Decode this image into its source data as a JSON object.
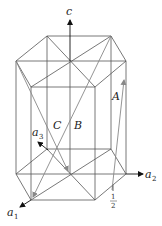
{
  "diagram": {
    "type": "hexagonal-prism-lattice",
    "labels": {
      "c": "c",
      "a1": "a",
      "a1_sub": "1",
      "a2": "a",
      "a2_sub": "2",
      "a3": "a",
      "a3_sub": "3",
      "A": "A",
      "B": "B",
      "C": "C",
      "half_num": "1",
      "half_den": "2"
    },
    "colors": {
      "edges": "#555555",
      "axes": "#111111",
      "vectors": "#888888"
    }
  }
}
